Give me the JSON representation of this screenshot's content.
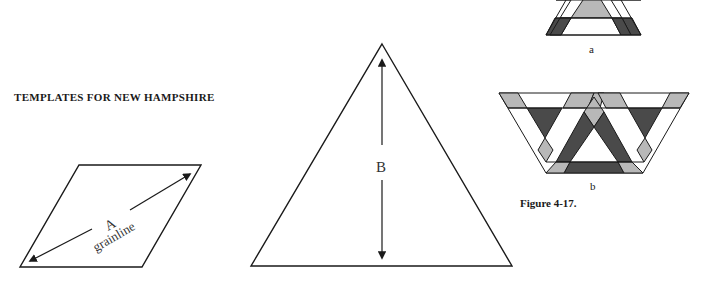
{
  "heading": "TEMPLATES FOR NEW HAMPSHIRE",
  "template_a": {
    "letter": "A",
    "label": "grainline"
  },
  "template_b": {
    "letter": "B"
  },
  "figure": {
    "subcaption_a": "a",
    "subcaption_b": "b",
    "caption": "Figure 4-17."
  },
  "colors": {
    "dark": "#4a4a4a",
    "light": "#b8b8b8",
    "line": "#1a1a1a"
  }
}
